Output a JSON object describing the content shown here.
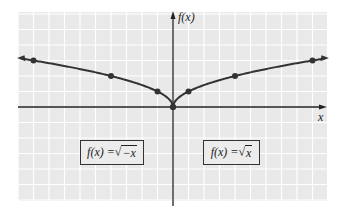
{
  "chart_data": {
    "type": "line",
    "title": "",
    "xlabel": "x",
    "ylabel": "f(x)",
    "xlim": [
      -10,
      10
    ],
    "ylim": [
      -6,
      6
    ],
    "grid": true,
    "legend_position": "boxed labels inside plot",
    "series": [
      {
        "name": "f(x) = √(−x)",
        "label_func": "f(x) = ",
        "label_radicand": "−x",
        "points": [
          [
            -9,
            3
          ],
          [
            -4,
            2
          ],
          [
            -1,
            1
          ],
          [
            0,
            0
          ]
        ],
        "arrow_end": "left"
      },
      {
        "name": "f(x) = √x",
        "label_func": "f(x) = ",
        "label_radicand": "x",
        "points": [
          [
            0,
            0
          ],
          [
            1,
            1
          ],
          [
            4,
            2
          ],
          [
            9,
            3
          ]
        ],
        "arrow_end": "right"
      }
    ]
  },
  "colors": {
    "background": "#e9e9e9",
    "grid": "#ffffff",
    "axis": "#222222",
    "curve": "#333333",
    "point": "#333333"
  },
  "labels": {
    "x_axis": "x",
    "y_axis": "f(x)",
    "left_box_func": "f(x) = ",
    "left_box_radicand": "−x",
    "right_box_func": "f(x) = ",
    "right_box_radicand": "x",
    "radical": "√"
  }
}
